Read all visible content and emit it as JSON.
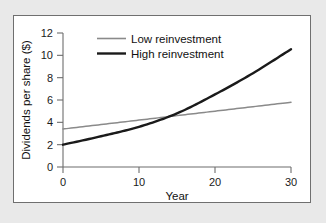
{
  "chart_data": {
    "type": "line",
    "title": "",
    "xlabel": "Year",
    "ylabel": "Dividends per share ($)",
    "xlim": [
      0,
      30
    ],
    "ylim": [
      0,
      12
    ],
    "xticks": [
      0,
      10,
      20,
      30
    ],
    "yticks": [
      0,
      2,
      4,
      6,
      8,
      10,
      12
    ],
    "xtick_labels": [
      "0",
      "10",
      "20",
      "30"
    ],
    "ytick_labels": [
      "0",
      "2",
      "4",
      "6",
      "8",
      "10",
      "12"
    ],
    "grid": false,
    "legend_position": "upper-center",
    "x": [
      0,
      5,
      10,
      15,
      20,
      25,
      30
    ],
    "series": [
      {
        "name": "Low reinvestment",
        "color": "#8a8a8a",
        "values": [
          3.4,
          3.8,
          4.2,
          4.6,
          5.0,
          5.4,
          5.8
        ]
      },
      {
        "name": "High reinvestment",
        "color": "#1a1a1a",
        "values": [
          2.0,
          2.75,
          3.6,
          4.8,
          6.5,
          8.4,
          10.55
        ]
      }
    ]
  },
  "legend": {
    "entries": [
      {
        "label": "Low reinvestment",
        "swatch": "low-reinvestment-line-swatch"
      },
      {
        "label": "High reinvestment",
        "swatch": "high-reinvestment-line-swatch"
      }
    ]
  },
  "axes": {
    "x_title": "Year",
    "y_title": "Dividends per share ($)"
  },
  "colors": {
    "panel_background": "#ffffff",
    "figure_background": "#e9e9e9",
    "panel_border": "#6f6f6f",
    "axis": "#6d6d6d",
    "low_series": "#8a8a8a",
    "high_series": "#1a1a1a",
    "text": "#111111"
  }
}
